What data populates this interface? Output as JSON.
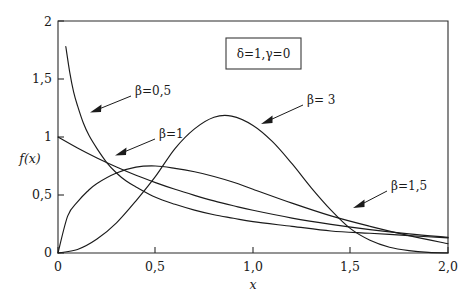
{
  "chart_data": {
    "type": "line",
    "title": "",
    "subtitle": "",
    "xlabel": "x",
    "ylabel": "f(x)",
    "xlim": [
      0,
      2.0
    ],
    "ylim": [
      0,
      2
    ],
    "grid": false,
    "legend_position": "inside-top-center",
    "x_ticks": [
      {
        "value": 0,
        "label": "0"
      },
      {
        "value": 0.5,
        "label": "0,5"
      },
      {
        "value": 1.0,
        "label": "1,0"
      },
      {
        "value": 1.5,
        "label": "1,5"
      },
      {
        "value": 2.0,
        "label": "2,0"
      }
    ],
    "y_ticks": [
      {
        "value": 0,
        "label": "0"
      },
      {
        "value": 0.5,
        "label": "0,5"
      },
      {
        "value": 1.0,
        "label": "1"
      },
      {
        "value": 1.5,
        "label": "1,5"
      },
      {
        "value": 2.0,
        "label": "2"
      }
    ],
    "annotations": [
      {
        "text": "δ = 1, γ = 0",
        "type": "parameter-box"
      }
    ],
    "series": [
      {
        "name": "β = 0,5",
        "label": "β=0,5",
        "beta": 0.5,
        "color": "#1b1b1b",
        "x": [
          0.04,
          0.06,
          0.08,
          0.1,
          0.13,
          0.16,
          0.2,
          0.25,
          0.3,
          0.35,
          0.4,
          0.5,
          0.6,
          0.7,
          0.8,
          0.9,
          1.0,
          1.2,
          1.4,
          1.6,
          1.8,
          2.0
        ],
        "y": [
          1.78,
          1.56,
          1.39,
          1.27,
          1.12,
          1.01,
          0.9,
          0.78,
          0.69,
          0.62,
          0.57,
          0.48,
          0.42,
          0.37,
          0.33,
          0.3,
          0.27,
          0.23,
          0.19,
          0.17,
          0.15,
          0.13
        ]
      },
      {
        "name": "β = 1",
        "label": "β=1",
        "beta": 1,
        "color": "#1b1b1b",
        "x": [
          0.0,
          0.1,
          0.2,
          0.3,
          0.4,
          0.5,
          0.6,
          0.7,
          0.8,
          0.9,
          1.0,
          1.2,
          1.4,
          1.6,
          1.8,
          2.0
        ],
        "y": [
          1.0,
          0.905,
          0.819,
          0.741,
          0.67,
          0.607,
          0.549,
          0.497,
          0.449,
          0.407,
          0.368,
          0.301,
          0.247,
          0.202,
          0.165,
          0.135
        ]
      },
      {
        "name": "β = 1,5",
        "label": "β=1,5",
        "beta": 1.5,
        "color": "#1b1b1b",
        "x": [
          0.0,
          0.05,
          0.1,
          0.15,
          0.2,
          0.3,
          0.4,
          0.5,
          0.6,
          0.7,
          0.8,
          0.9,
          1.0,
          1.2,
          1.4,
          1.6,
          1.8,
          2.0
        ],
        "y": [
          0.0,
          0.32,
          0.44,
          0.53,
          0.6,
          0.69,
          0.74,
          0.75,
          0.73,
          0.7,
          0.66,
          0.61,
          0.55,
          0.43,
          0.32,
          0.23,
          0.15,
          0.08
        ]
      },
      {
        "name": "β = 3",
        "label": "β= 3",
        "beta": 3,
        "color": "#1b1b1b",
        "x": [
          0.0,
          0.1,
          0.2,
          0.3,
          0.4,
          0.5,
          0.6,
          0.7,
          0.8,
          0.89,
          1.0,
          1.1,
          1.2,
          1.3,
          1.4,
          1.5,
          1.6,
          1.7,
          1.8,
          1.9,
          2.0
        ],
        "y": [
          0.0,
          0.03,
          0.12,
          0.26,
          0.45,
          0.66,
          0.9,
          1.07,
          1.17,
          1.18,
          1.1,
          0.96,
          0.77,
          0.56,
          0.37,
          0.21,
          0.11,
          0.05,
          0.02,
          0.005,
          0.001
        ]
      }
    ],
    "series_label_positions": [
      {
        "label": "β=0,5",
        "x_px": 141,
        "y_px": 91,
        "arrow_from_x": 131,
        "arrow_from_y": 96,
        "arrow_to_x": 90,
        "arrow_to_y": 112
      },
      {
        "label": "β=1",
        "x_px": 160,
        "y_px": 133,
        "arrow_from_x": 153,
        "arrow_from_y": 139,
        "arrow_to_x": 115,
        "arrow_to_y": 155
      },
      {
        "label": "β= 3",
        "x_px": 308,
        "y_px": 101,
        "arrow_from_x": 301,
        "arrow_from_y": 106,
        "arrow_to_x": 261,
        "arrow_to_y": 124
      },
      {
        "label": "β=1,5",
        "x_px": 392,
        "y_px": 186,
        "arrow_from_x": 385,
        "arrow_from_y": 192,
        "arrow_to_x": 353,
        "arrow_to_y": 208
      }
    ]
  },
  "axes": {
    "x_axis_title": "x",
    "y_axis_title": "f(x)"
  },
  "legend": {
    "delta_text": "δ",
    "delta_eq": "=1,",
    "gamma_text": "γ",
    "gamma_eq": "=0",
    "full_text": "δ=1,γ=0"
  },
  "colors": {
    "curve": "#1b1b1b",
    "frame": "#2b2b2b",
    "background": "#ffffff",
    "text": "#1a1a1a"
  }
}
